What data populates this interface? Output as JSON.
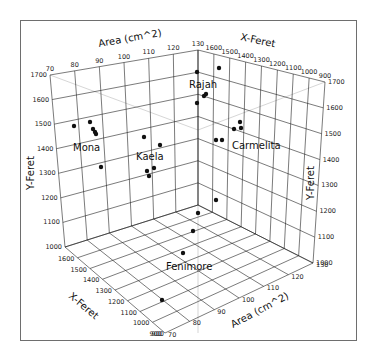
{
  "chart_data": {
    "type": "scatter",
    "projection": "3d",
    "title": "",
    "axes": {
      "x": {
        "label": "X-Feret",
        "ticks": [
          900,
          1000,
          1100,
          1200,
          1300,
          1400,
          1500,
          1600,
          1700
        ],
        "range": [
          900,
          1700
        ]
      },
      "y": {
        "label": "Y-Feret",
        "ticks": [
          1000,
          1100,
          1200,
          1300,
          1400,
          1500,
          1600,
          1700
        ],
        "range": [
          1000,
          1700
        ]
      },
      "z": {
        "label": "Area (cm^2)",
        "ticks": [
          70,
          80,
          90,
          100,
          110,
          120,
          130
        ],
        "range": [
          70,
          130
        ]
      }
    },
    "grid": true,
    "legend": null,
    "group_labels": [
      "Mona",
      "Kaela",
      "Rajah",
      "Carmelita",
      "Fenimore"
    ],
    "series": [
      {
        "name": "Mona",
        "points_px": [
          [
            74,
            126
          ],
          [
            90,
            122
          ],
          [
            93,
            129
          ],
          [
            95,
            132
          ],
          [
            96,
            134
          ],
          [
            101,
            167
          ]
        ]
      },
      {
        "name": "Kaela",
        "points_px": [
          [
            144,
            137
          ],
          [
            160,
            145
          ],
          [
            147,
            171
          ],
          [
            154,
            168
          ],
          [
            149,
            176
          ]
        ]
      },
      {
        "name": "Rajah",
        "points_px": [
          [
            197,
            72
          ],
          [
            219,
            68
          ],
          [
            204,
            96
          ],
          [
            206,
            94
          ],
          [
            197,
            103
          ]
        ]
      },
      {
        "name": "Carmelita",
        "points_px": [
          [
            240,
            122
          ],
          [
            241,
            128
          ],
          [
            234,
            129
          ],
          [
            216,
            140
          ],
          [
            222,
            140
          ]
        ]
      },
      {
        "name": "Fenimore",
        "points_px": [
          [
            216,
            200
          ],
          [
            198,
            213
          ],
          [
            193,
            231
          ],
          [
            183,
            253
          ],
          [
            162,
            300
          ]
        ]
      }
    ]
  },
  "labels": {
    "area_top": "Area (cm^2)",
    "area_bottom": "Area (cm^2)",
    "xferet_top": "X-Feret",
    "xferet_bottom": "X-Feret",
    "yferet_left": "Y-Feret",
    "yferet_right": "Y-Feret",
    "mona": "Mona",
    "kaela": "Kaela",
    "rajah": "Rajah",
    "carmelita": "Carmelita",
    "fenimore": "Fenimore"
  },
  "ticks": {
    "area_top": [
      "70",
      "80",
      "90",
      "100",
      "110",
      "120",
      "130"
    ],
    "xferet_top": [
      "1700",
      "1600",
      "1500",
      "1400",
      "1300",
      "1200",
      "1100",
      "1000",
      "900"
    ],
    "yferet_left": [
      "1700",
      "1600",
      "1500",
      "1400",
      "1300",
      "1200",
      "1100",
      "1000"
    ],
    "yferet_right": [
      "1700",
      "1600",
      "1500",
      "1400",
      "1300",
      "1200",
      "1100",
      "1000"
    ],
    "xferet_bottom": [
      "1700",
      "1600",
      "1500",
      "1400",
      "1300",
      "1200",
      "1100",
      "1000",
      "900"
    ],
    "area_bottom": [
      "70",
      "80",
      "90",
      "100",
      "110",
      "120",
      "130"
    ]
  }
}
